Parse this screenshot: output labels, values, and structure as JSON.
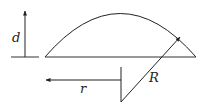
{
  "diagram": {
    "labels": {
      "height": "d",
      "base_radius": "r",
      "sphere_radius": "R"
    },
    "colors": {
      "stroke": "#222222",
      "background": "#ffffff"
    }
  }
}
